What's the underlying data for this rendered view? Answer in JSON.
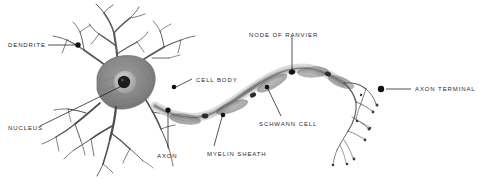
{
  "figure": {
    "style": "pencil sketch, greyscale",
    "background_color": "#ffffff",
    "label_color": "#2b2b2b",
    "leader_color": "#1a1a1a",
    "cell_fill": "#8a8a8a",
    "nucleus_color": "#1d1d1d",
    "axon_color": "#6e6e6e"
  },
  "labels": [
    {
      "id": "dendrite",
      "text": "DENDRITE",
      "x": 8,
      "y": 41,
      "align": "left"
    },
    {
      "id": "nucleus",
      "text": "NUCLEUS",
      "x": 8,
      "y": 124,
      "align": "left"
    },
    {
      "id": "cell-body",
      "text": "CELL BODY",
      "x": 196,
      "y": 76,
      "align": "left"
    },
    {
      "id": "node-of-ranvier",
      "text": "NODE OF RANVIER",
      "x": 249,
      "y": 31,
      "align": "left"
    },
    {
      "id": "axon",
      "text": "AXON",
      "x": 157,
      "y": 152,
      "align": "left"
    },
    {
      "id": "myelin-sheath",
      "text": "MYELIN SHEATH",
      "x": 207,
      "y": 150,
      "align": "left"
    },
    {
      "id": "schwann-cell",
      "text": "SCHWANN CELL",
      "x": 259,
      "y": 120,
      "align": "left"
    },
    {
      "id": "axon-terminal",
      "text": "AXON TERMINAL",
      "x": 415,
      "y": 85,
      "align": "left"
    }
  ],
  "leaders": [
    {
      "id": "dendrite",
      "line": [
        48,
        45,
        76,
        45
      ],
      "dot": [
        78,
        45
      ]
    },
    {
      "id": "nucleus",
      "line": [
        40,
        126,
        128,
        83
      ],
      "dot": null
    },
    {
      "id": "cell-body",
      "line": [
        176,
        86,
        192,
        79
      ],
      "dot": [
        174,
        87
      ]
    },
    {
      "id": "node-of-ranvier",
      "line": [
        292,
        36,
        292,
        71
      ],
      "dot": [
        292,
        72
      ]
    },
    {
      "id": "axon",
      "line": [
        168,
        112,
        168,
        148
      ],
      "dot": [
        168,
        110
      ]
    },
    {
      "id": "myelin-sheath",
      "line": [
        222,
        117,
        214,
        146
      ],
      "dot": [
        223,
        115
      ]
    },
    {
      "id": "schwann-cell",
      "line": [
        268,
        89,
        281,
        116
      ],
      "dot": [
        267,
        87
      ]
    },
    {
      "id": "axon-terminal",
      "line": [
        386,
        89,
        411,
        89
      ],
      "dot": [
        381,
        89
      ]
    }
  ],
  "parts": {
    "soma": "cell body / soma, grey shaded",
    "nucleus": "dark round nucleus with halo",
    "dendrites": "branching tree-like processes, upper and lower left",
    "axon": "wavy band extending right",
    "myelin": "darker segments along axon",
    "nodes": "gaps between myelin segments",
    "terminals": "fine branches with bulbous tips at far right"
  }
}
